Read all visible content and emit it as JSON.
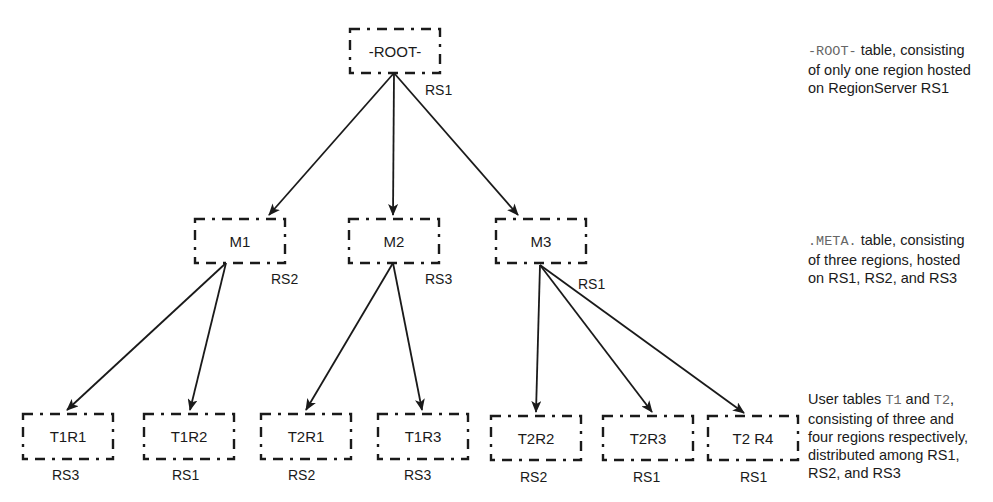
{
  "nodes": {
    "root": {
      "label": "-ROOT-",
      "server": "RS1"
    },
    "m1": {
      "label": "M1",
      "server": "RS2"
    },
    "m2": {
      "label": "M2",
      "server": "RS3"
    },
    "m3": {
      "label": "M3",
      "server": "RS1"
    },
    "t1r1": {
      "label": "T1R1",
      "server": "RS3"
    },
    "t1r2": {
      "label": "T1R2",
      "server": "RS1"
    },
    "t2r1": {
      "label": "T2R1",
      "server": "RS2"
    },
    "t1r3": {
      "label": "T1R3",
      "server": "RS3"
    },
    "t2r2": {
      "label": "T2R2",
      "server": "RS2"
    },
    "t2r3": {
      "label": "T2R3",
      "server": "RS1"
    },
    "t2r4": {
      "label": "T2 R4",
      "server": "RS1"
    }
  },
  "edges": [
    [
      "root",
      "m1"
    ],
    [
      "root",
      "m2"
    ],
    [
      "root",
      "m3"
    ],
    [
      "m1",
      "t1r1"
    ],
    [
      "m1",
      "t1r2"
    ],
    [
      "m2",
      "t2r1"
    ],
    [
      "m2",
      "t1r3"
    ],
    [
      "m3",
      "t2r2"
    ],
    [
      "m3",
      "t2r3"
    ],
    [
      "m3",
      "t2r4"
    ]
  ],
  "notes": {
    "root": {
      "code": "-ROOT-",
      "line1": " table, consisting",
      "line2": "of only one region hosted",
      "line3": "on RegionServer RS1"
    },
    "meta": {
      "code": ".META.",
      "line1": " table, consisting",
      "line2": "of three regions, hosted",
      "line3": "on RS1, RS2, and RS3"
    },
    "user": {
      "prefix": "User tables ",
      "code1": "T1",
      "mid": " and ",
      "code2": "T2",
      "suffix": ",",
      "line2": "consisting of three and",
      "line3": "four regions respectively,",
      "line4": "distributed among RS1,",
      "line5": "RS2, and RS3"
    }
  }
}
